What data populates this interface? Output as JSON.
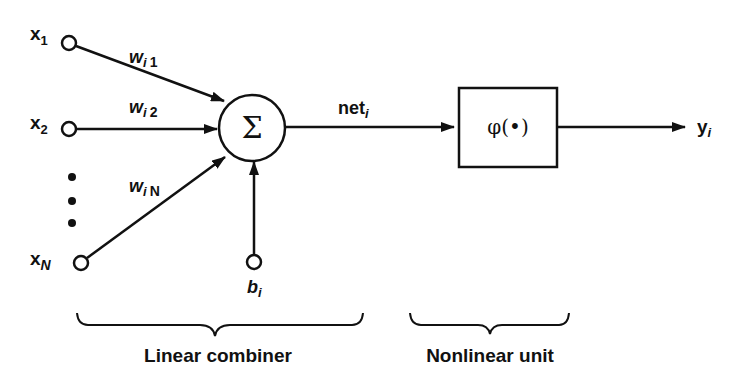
{
  "diagram": {
    "inputs": [
      {
        "label": "x",
        "sub": "1",
        "weight_label": "w",
        "weight_sub_i": "i",
        "weight_sub": "1"
      },
      {
        "label": "x",
        "sub": "2",
        "weight_label": "w",
        "weight_sub_i": "i",
        "weight_sub": "2"
      },
      {
        "label": "x",
        "sub": "N",
        "weight_label": "w",
        "weight_sub_i": "i",
        "weight_sub": "N"
      }
    ],
    "ellipsis": "⋮",
    "summation": {
      "symbol": "Σ"
    },
    "bias": {
      "label": "b",
      "sub": "i"
    },
    "net": {
      "label": "net",
      "sub": "i"
    },
    "activation": {
      "symbol": "φ(•)"
    },
    "output": {
      "label": "y",
      "sub": "i"
    },
    "groups": [
      {
        "label": "Linear combiner"
      },
      {
        "label": "Nonlinear unit"
      }
    ],
    "colors": {
      "stroke": "#111111",
      "background": "#ffffff"
    }
  }
}
